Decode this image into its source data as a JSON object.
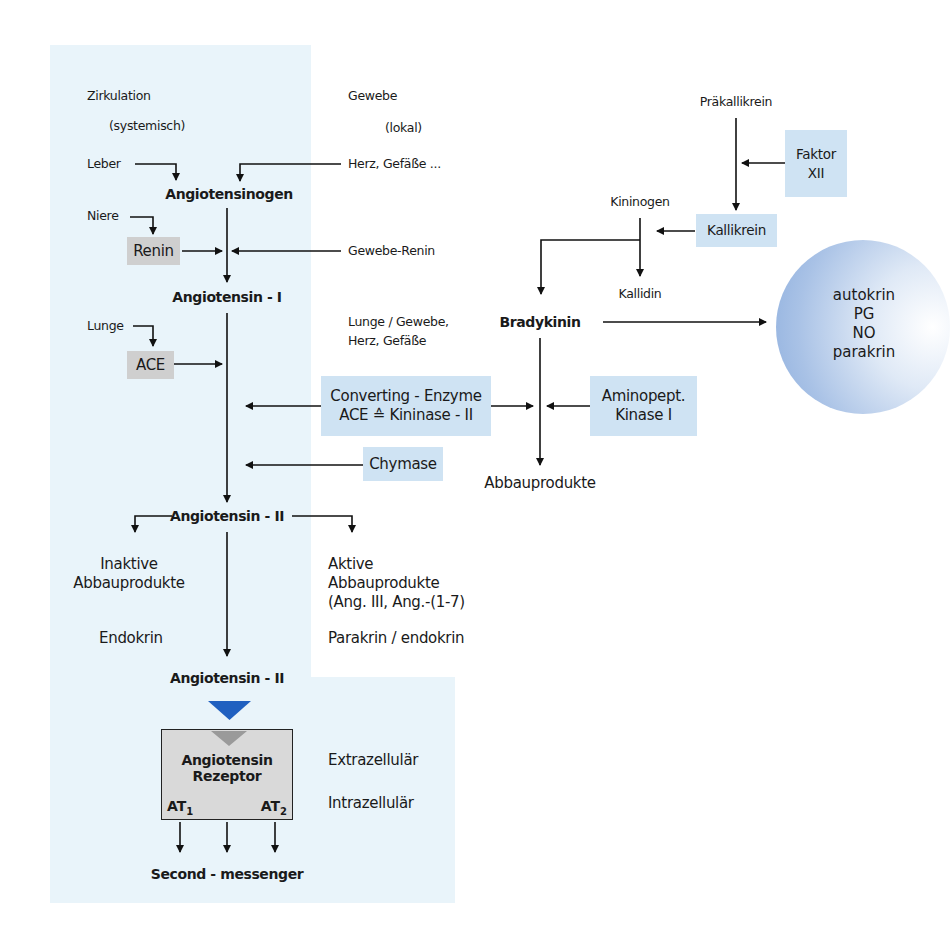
{
  "diagram": {
    "type": "pathway",
    "columns": {
      "circulation": "Zirkulation",
      "circulation_sub": "(systemisch)",
      "tissue": "Gewebe",
      "tissue_sub": "(lokal)"
    },
    "sources": {
      "leber": "Leber",
      "herz_gefaesse": "Herz, Gefäße ...",
      "niere": "Niere",
      "gewebe_renin": "Gewebe-Renin",
      "lunge": "Lunge",
      "lunge_gewebe_1": "Lunge / Gewebe,",
      "lunge_gewebe_2": "Herz, Gefäße"
    },
    "nodes": {
      "angiotensinogen": "Angiotensinogen",
      "angiotensin_1": "Angiotensin - I",
      "angiotensin_2": "Angiotensin - II",
      "angiotensin_2b": "Angiotensin - II",
      "inaktive_1": "Inaktive",
      "inaktive_2": "Abbauprodukte",
      "aktive_1": "Aktive",
      "aktive_2": "Abbauprodukte",
      "aktive_3": "(Ang. III, Ang.-(1-7)",
      "endokrin": "Endokrin",
      "parakrin_endokrin": "Parakrin / endokrin",
      "second_messenger": "Second - messenger",
      "praekallikrein": "Präkallikrein",
      "kininogen": "Kininogen",
      "kallidin": "Kallidin",
      "bradykinin": "Bradykinin",
      "abbauprodukte": "Abbauprodukte"
    },
    "enzymes": {
      "renin": "Renin",
      "ace": "ACE",
      "converting_1": "Converting - Enzyme",
      "converting_2": "ACE ≙ Kininase - II",
      "chymase": "Chymase",
      "aminopept_1": "Aminopept.",
      "aminopept_2": "Kinase I",
      "faktor_1": "Faktor",
      "faktor_2": "XII",
      "kallikrein": "Kallikrein"
    },
    "receptor": {
      "title_1": "Angiotensin",
      "title_2": "Rezeptor",
      "at1": "AT",
      "at1_sub": "1",
      "at2": "AT",
      "at2_sub": "2",
      "extracellular": "Extrazellulär",
      "intracellular": "Intrazellulär"
    },
    "effects": {
      "line1": "autokrin",
      "line2": "PG",
      "line3": "NO",
      "line4": "parakrin"
    },
    "colors": {
      "panel": "#e9f4fa",
      "enzyme_blue": "#cfe3f3",
      "enzyme_grey": "#cfcfcf",
      "ligand_triangle": "#2060c0",
      "receptor": "#d9d9d9",
      "circle": "#8eafde"
    }
  }
}
